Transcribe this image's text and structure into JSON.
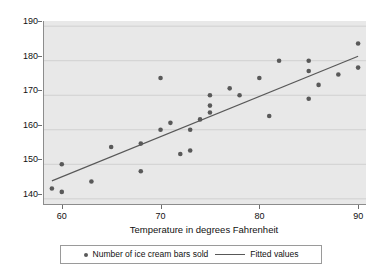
{
  "chart_data": {
    "type": "scatter",
    "title": "",
    "xlabel": "Temperature in degrees Fahrenheit",
    "ylabel": "",
    "xlim": [
      58.2,
      90.8
    ],
    "ylim": [
      138.5,
      191.5
    ],
    "xticks": [
      60,
      70,
      80,
      90
    ],
    "yticks": [
      140,
      150,
      160,
      170,
      180,
      190
    ],
    "grid": "horizontal",
    "legend_position": "below-plot",
    "series": [
      {
        "name": "Number of ice cream bars sold",
        "type": "scatter",
        "marker": "circle",
        "color": "#595959",
        "x": [
          59,
          60,
          60,
          63,
          65,
          68,
          68,
          70,
          70,
          71,
          72,
          73,
          73,
          74,
          75,
          75,
          75,
          77,
          78,
          80,
          81,
          82,
          85,
          85,
          85,
          86,
          88,
          90,
          90
        ],
        "y": [
          143,
          142,
          150,
          145,
          155,
          148,
          156,
          160,
          175,
          162,
          153,
          154,
          160,
          163,
          165,
          167,
          170,
          172,
          170,
          175,
          164,
          180,
          169,
          177,
          180,
          173,
          176,
          178,
          185
        ]
      },
      {
        "name": "Fitted values",
        "type": "line",
        "color": "#585858",
        "x": [
          59,
          90
        ],
        "y": [
          145.2,
          181.3
        ]
      }
    ]
  },
  "axis": {
    "ytick_labels": [
      "190",
      "180",
      "170",
      "160",
      "150",
      "140"
    ],
    "xtick_labels": [
      "60",
      "70",
      "80",
      "90"
    ],
    "x_title": "Temperature in degrees Fahrenheit"
  },
  "legend": {
    "entries": [
      {
        "label": "Number of ice cream bars sold",
        "glyph": "scatter-dot-icon"
      },
      {
        "label": "Fitted values",
        "glyph": "line-segment-icon"
      }
    ]
  },
  "colors": {
    "plot_background": "#e8e8e8",
    "figure_background": "#ffffff",
    "marker": "#595959",
    "fit_line": "#585858",
    "gridline": "#d0d0d0",
    "axis": "#8c8c8c"
  }
}
